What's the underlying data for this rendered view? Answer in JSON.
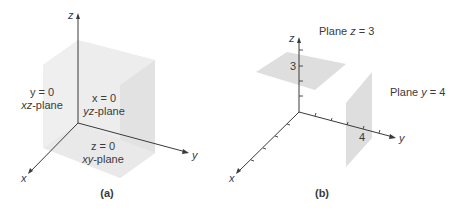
{
  "figure_a": {
    "caption": "(a)",
    "axes": {
      "x": "x",
      "y": "y",
      "z": "z"
    },
    "planes": [
      {
        "equation": "y = 0",
        "name": "xz-plane",
        "name_var": "xz",
        "name_suffix": "-plane"
      },
      {
        "equation": "x = 0",
        "name": "yz-plane",
        "name_var": "yz",
        "name_suffix": "-plane"
      },
      {
        "equation": "z = 0",
        "name": "xy-plane",
        "name_var": "xy",
        "name_suffix": "-plane"
      }
    ],
    "colors": {
      "top_face": "#f4f4f4",
      "left_face": "#eeeeee",
      "right_face": "#e2e2e2",
      "bottom_face": "#e9e9e9"
    }
  },
  "figure_b": {
    "caption": "(b)",
    "axes": {
      "x": "x",
      "y": "y",
      "z": "z"
    },
    "tick_labels": {
      "z": "3",
      "y": "4"
    },
    "planes": [
      {
        "label": "Plane z = 3",
        "prefix": "Plane ",
        "var": "z",
        "rest": " = 3"
      },
      {
        "label": "Plane y = 4",
        "prefix": "Plane ",
        "var": "y",
        "rest": " = 4"
      }
    ],
    "colors": {
      "plane_fill": "#dedede"
    }
  }
}
